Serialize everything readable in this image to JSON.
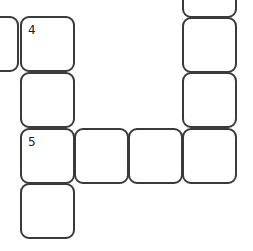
{
  "puzzle": {
    "type": "crossword-fragment",
    "border_color": "#3a3a3a",
    "background": "#ffffff",
    "cells": [
      {
        "id": "c0",
        "left": -36,
        "top": 16,
        "number": ""
      },
      {
        "id": "c1",
        "left": 20,
        "top": 16,
        "number": "4"
      },
      {
        "id": "c2",
        "left": 20,
        "top": 72,
        "number": ""
      },
      {
        "id": "c3",
        "left": 20,
        "top": 128,
        "number": "5"
      },
      {
        "id": "c4",
        "left": 20,
        "top": 183,
        "number": ""
      },
      {
        "id": "c5",
        "left": 74,
        "top": 128,
        "number": ""
      },
      {
        "id": "c6",
        "left": 128,
        "top": 128,
        "number": ""
      },
      {
        "id": "c7",
        "left": 182,
        "top": 128,
        "number": ""
      },
      {
        "id": "c8",
        "left": 182,
        "top": 72,
        "number": ""
      },
      {
        "id": "c9",
        "left": 182,
        "top": 17,
        "number": ""
      },
      {
        "id": "c10",
        "left": 182,
        "top": -38,
        "number": ""
      }
    ],
    "labels": {
      "n4": "4",
      "n5": "5"
    }
  }
}
